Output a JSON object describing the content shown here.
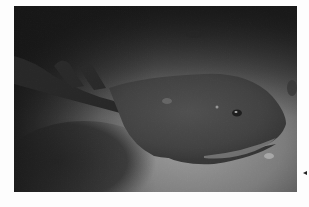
{
  "image": {
    "subject": "electric ray resting on sandy seabed",
    "palette": {
      "sand_light": "#9a9a9a",
      "sand_mid": "#6e6e6e",
      "sand_dark": "#262626",
      "ray_body": "#3c3c3c",
      "ray_shadow": "#1a1a1a",
      "background": "#fdfdfd"
    }
  },
  "navigation": {
    "arrow_icon": "triangle-left-icon"
  }
}
